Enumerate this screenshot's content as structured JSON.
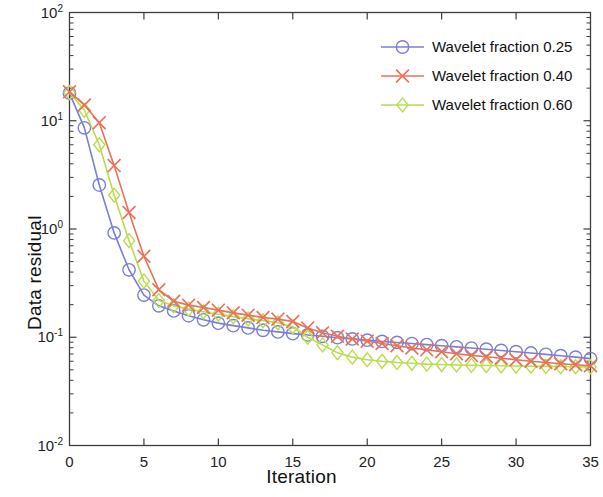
{
  "chart_data": {
    "type": "line",
    "title": "",
    "xlabel": "Iteration",
    "ylabel": "Data residual",
    "yscale": "log",
    "xlim": [
      0,
      35
    ],
    "ylim": [
      0.01,
      100
    ],
    "xticks": [
      "0",
      "5",
      "10",
      "15",
      "20",
      "25",
      "30",
      "35"
    ],
    "xtick_values": [
      0,
      5,
      10,
      15,
      20,
      25,
      30,
      35
    ],
    "ytick_labels": [
      "10-2",
      "10-1",
      "100",
      "101",
      "102"
    ],
    "ytick_bases": [
      "10",
      "10",
      "10",
      "10",
      "10"
    ],
    "ytick_exponents": [
      "-2",
      "-1",
      "0",
      "1",
      "2"
    ],
    "ytick_values": [
      0.01,
      0.1,
      1,
      10,
      100
    ],
    "grid": false,
    "box": true,
    "legend_position": "upper right",
    "x": [
      0,
      1,
      2,
      3,
      4,
      5,
      6,
      7,
      8,
      9,
      10,
      11,
      12,
      13,
      14,
      15,
      16,
      17,
      18,
      19,
      20,
      21,
      22,
      23,
      24,
      25,
      26,
      27,
      28,
      29,
      30,
      31,
      32,
      33,
      34,
      35
    ],
    "series": [
      {
        "name": "Wavelet fraction 0.25",
        "color": "#7b7fd4",
        "marker": "circle",
        "values": [
          18.0,
          8.6,
          2.55,
          0.92,
          0.42,
          0.245,
          0.195,
          0.175,
          0.158,
          0.145,
          0.135,
          0.128,
          0.122,
          0.116,
          0.112,
          0.108,
          0.105,
          0.102,
          0.099,
          0.0965,
          0.094,
          0.0915,
          0.0895,
          0.0875,
          0.0855,
          0.0835,
          0.0815,
          0.0795,
          0.0775,
          0.0755,
          0.0735,
          0.0715,
          0.0695,
          0.0675,
          0.0655,
          0.0635
        ]
      },
      {
        "name": "Wavelet fraction 0.40",
        "color": "#e8735a",
        "marker": "x",
        "values": [
          18.5,
          14.0,
          9.6,
          3.85,
          1.42,
          0.56,
          0.275,
          0.215,
          0.198,
          0.188,
          0.178,
          0.168,
          0.16,
          0.152,
          0.147,
          0.14,
          0.122,
          0.11,
          0.102,
          0.0965,
          0.092,
          0.0875,
          0.0835,
          0.0795,
          0.0765,
          0.0735,
          0.0705,
          0.068,
          0.066,
          0.064,
          0.062,
          0.06,
          0.0585,
          0.057,
          0.0558,
          0.0545
        ]
      },
      {
        "name": "Wavelet fraction 0.60",
        "color": "#b8dd50",
        "marker": "diamond",
        "values": [
          18.2,
          12.5,
          6.0,
          2.05,
          0.78,
          0.33,
          0.218,
          0.195,
          0.182,
          0.172,
          0.163,
          0.155,
          0.148,
          0.142,
          0.136,
          0.125,
          0.1,
          0.085,
          0.072,
          0.0655,
          0.062,
          0.06,
          0.0585,
          0.0575,
          0.0565,
          0.056,
          0.0555,
          0.055,
          0.0548,
          0.0545,
          0.0542,
          0.054,
          0.0538,
          0.0536,
          0.0534,
          0.0532
        ]
      }
    ]
  },
  "legend": {
    "entries": [
      {
        "label": "Wavelet fraction 0.25"
      },
      {
        "label": "Wavelet fraction 0.40"
      },
      {
        "label": "Wavelet fraction 0.60"
      }
    ]
  },
  "axes": {
    "xlabel": "Iteration",
    "ylabel": "Data residual"
  }
}
